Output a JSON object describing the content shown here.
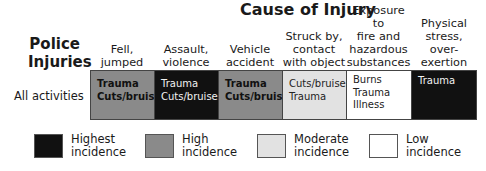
{
  "title": "Cause of Injury",
  "row_title": [
    "Police",
    "Injuries"
  ],
  "colors": {
    "highest": "#111111",
    "high": "#8a8a8a",
    "moderate": "#e2e2e2",
    "low": "#ffffff"
  },
  "columns": [
    {
      "label_lines": [
        "Fell,",
        "jumped"
      ]
    },
    {
      "label_lines": [
        "Assault,",
        "violence"
      ]
    },
    {
      "label_lines": [
        "Vehicle",
        "accident"
      ]
    },
    {
      "label_lines": [
        "Struck by,",
        "contact",
        "with object"
      ]
    },
    {
      "label_lines": [
        "Exposure to",
        "fire and",
        "hazardous",
        "substances"
      ]
    },
    {
      "label_lines": [
        "Physical",
        "stress, over-",
        "exertion"
      ]
    }
  ],
  "rows": [
    {
      "label": "All activities",
      "cells": [
        {
          "level": "high",
          "items": [
            "Trauma",
            "Cuts/bruises"
          ]
        },
        {
          "level": "highest",
          "items": [
            "Trauma",
            "Cuts/bruises"
          ]
        },
        {
          "level": "high",
          "items": [
            "Trauma",
            "Cuts/bruises"
          ]
        },
        {
          "level": "moderate",
          "items": [
            "Cuts/bruises",
            "Trauma"
          ]
        },
        {
          "level": "low",
          "items": [
            "Burns",
            "Trauma",
            "Illness"
          ]
        },
        {
          "level": "highest",
          "items": [
            "Trauma"
          ]
        }
      ]
    }
  ],
  "legend": [
    {
      "level": "highest",
      "lines": [
        "Highest",
        "incidence"
      ]
    },
    {
      "level": "high",
      "lines": [
        "High",
        "incidence"
      ]
    },
    {
      "level": "moderate",
      "lines": [
        "Moderate",
        "incidence"
      ]
    },
    {
      "level": "low",
      "lines": [
        "Low",
        "incidence"
      ]
    }
  ]
}
